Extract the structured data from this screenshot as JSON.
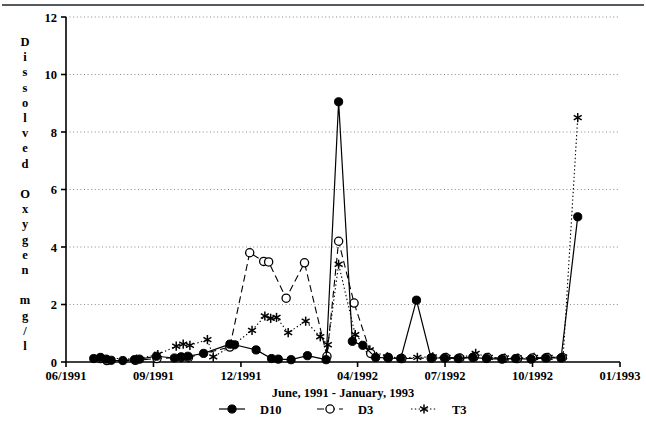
{
  "chart_data": {
    "type": "line",
    "title": "",
    "xlabel": "June, 1991 - January, 1993",
    "ylabel": "Dissolved Oxygen mg/l",
    "ylabel_letters": [
      "D",
      "i",
      "s",
      "s",
      "o",
      "l",
      "v",
      "e",
      "d",
      "",
      "O",
      "x",
      "y",
      "g",
      "e",
      "n",
      "",
      "m",
      "g",
      "/",
      "l"
    ],
    "ylim": [
      0,
      12
    ],
    "yticks": [
      0,
      2,
      4,
      6,
      8,
      10,
      12
    ],
    "ytick_labels": [
      "0",
      "2",
      "4",
      "6",
      "8",
      "10",
      "12"
    ],
    "xlim": [
      0,
      19
    ],
    "xticks": [
      0,
      3,
      6,
      10,
      13,
      16,
      19
    ],
    "xtick_labels": [
      "06/1991",
      "09/1991",
      "12/1991",
      "04/1992",
      "07/1992",
      "10/1992",
      "01/1993"
    ],
    "grid": "horizontal-dotted",
    "legend_position": "below-axis",
    "series": [
      {
        "name": "D10",
        "marker": "filled-circle",
        "line": "solid",
        "color": "#000000",
        "points": [
          {
            "x": 0.95,
            "y": 0.12
          },
          {
            "x": 1.18,
            "y": 0.16
          },
          {
            "x": 1.38,
            "y": 0.1
          },
          {
            "x": 1.55,
            "y": 0.06
          },
          {
            "x": 1.95,
            "y": 0.05
          },
          {
            "x": 2.35,
            "y": 0.08
          },
          {
            "x": 2.52,
            "y": 0.1
          },
          {
            "x": 3.1,
            "y": 0.2
          },
          {
            "x": 3.72,
            "y": 0.14
          },
          {
            "x": 3.95,
            "y": 0.18
          },
          {
            "x": 4.18,
            "y": 0.2
          },
          {
            "x": 4.72,
            "y": 0.3
          },
          {
            "x": 5.62,
            "y": 0.62
          },
          {
            "x": 5.78,
            "y": 0.6
          },
          {
            "x": 6.52,
            "y": 0.42
          },
          {
            "x": 7.05,
            "y": 0.12
          },
          {
            "x": 7.28,
            "y": 0.1
          },
          {
            "x": 7.72,
            "y": 0.08
          },
          {
            "x": 8.28,
            "y": 0.22
          },
          {
            "x": 8.92,
            "y": 0.08
          },
          {
            "x": 9.35,
            "y": 9.05
          },
          {
            "x": 9.82,
            "y": 0.72
          },
          {
            "x": 10.18,
            "y": 0.58
          },
          {
            "x": 10.62,
            "y": 0.16
          },
          {
            "x": 11.05,
            "y": 0.14
          },
          {
            "x": 11.48,
            "y": 0.12
          },
          {
            "x": 12.02,
            "y": 2.15
          },
          {
            "x": 12.52,
            "y": 0.14
          },
          {
            "x": 12.98,
            "y": 0.14
          },
          {
            "x": 13.45,
            "y": 0.12
          },
          {
            "x": 13.95,
            "y": 0.16
          },
          {
            "x": 14.42,
            "y": 0.12
          },
          {
            "x": 14.95,
            "y": 0.1
          },
          {
            "x": 15.42,
            "y": 0.12
          },
          {
            "x": 15.95,
            "y": 0.1
          },
          {
            "x": 16.45,
            "y": 0.14
          },
          {
            "x": 16.98,
            "y": 0.14
          },
          {
            "x": 17.55,
            "y": 5.05
          }
        ]
      },
      {
        "name": "D3",
        "marker": "open-circle",
        "line": "dashed",
        "color": "#000000",
        "points": [
          {
            "x": 1.18,
            "y": 0.12
          },
          {
            "x": 1.4,
            "y": 0.05
          },
          {
            "x": 2.38,
            "y": 0.06
          },
          {
            "x": 3.12,
            "y": 0.12
          },
          {
            "x": 3.95,
            "y": 0.16
          },
          {
            "x": 4.2,
            "y": 0.16
          },
          {
            "x": 5.62,
            "y": 0.52
          },
          {
            "x": 6.3,
            "y": 3.8
          },
          {
            "x": 6.78,
            "y": 3.5
          },
          {
            "x": 6.95,
            "y": 3.48
          },
          {
            "x": 7.55,
            "y": 2.22
          },
          {
            "x": 8.18,
            "y": 3.45
          },
          {
            "x": 8.95,
            "y": 0.2
          },
          {
            "x": 9.35,
            "y": 4.2
          },
          {
            "x": 9.88,
            "y": 2.05
          },
          {
            "x": 10.45,
            "y": 0.3
          },
          {
            "x": 11.05,
            "y": 0.16
          },
          {
            "x": 11.52,
            "y": 0.12
          },
          {
            "x": 12.55,
            "y": 0.14
          },
          {
            "x": 13.02,
            "y": 0.16
          },
          {
            "x": 13.5,
            "y": 0.14
          },
          {
            "x": 14.0,
            "y": 0.18
          },
          {
            "x": 14.45,
            "y": 0.16
          },
          {
            "x": 15.0,
            "y": 0.12
          },
          {
            "x": 15.48,
            "y": 0.12
          },
          {
            "x": 16.0,
            "y": 0.14
          },
          {
            "x": 16.5,
            "y": 0.16
          },
          {
            "x": 17.02,
            "y": 0.16
          }
        ]
      },
      {
        "name": "T3",
        "marker": "asterisk",
        "line": "dotted",
        "color": "#000000",
        "points": [
          {
            "x": 1.22,
            "y": 0.14
          },
          {
            "x": 2.42,
            "y": 0.1
          },
          {
            "x": 3.15,
            "y": 0.26
          },
          {
            "x": 3.78,
            "y": 0.55
          },
          {
            "x": 4.02,
            "y": 0.62
          },
          {
            "x": 4.25,
            "y": 0.58
          },
          {
            "x": 4.85,
            "y": 0.78
          },
          {
            "x": 5.05,
            "y": 0.18
          },
          {
            "x": 5.68,
            "y": 0.55
          },
          {
            "x": 6.38,
            "y": 1.1
          },
          {
            "x": 6.82,
            "y": 1.6
          },
          {
            "x": 7.02,
            "y": 1.52
          },
          {
            "x": 7.22,
            "y": 1.55
          },
          {
            "x": 7.62,
            "y": 1.02
          },
          {
            "x": 8.22,
            "y": 1.42
          },
          {
            "x": 8.72,
            "y": 0.88
          },
          {
            "x": 8.98,
            "y": 0.6
          },
          {
            "x": 9.35,
            "y": 3.4
          },
          {
            "x": 9.92,
            "y": 0.95
          },
          {
            "x": 10.42,
            "y": 0.42
          },
          {
            "x": 11.02,
            "y": 0.18
          },
          {
            "x": 11.5,
            "y": 0.14
          },
          {
            "x": 12.05,
            "y": 0.16
          },
          {
            "x": 12.58,
            "y": 0.18
          },
          {
            "x": 13.05,
            "y": 0.16
          },
          {
            "x": 13.52,
            "y": 0.14
          },
          {
            "x": 14.05,
            "y": 0.3
          },
          {
            "x": 14.5,
            "y": 0.16
          },
          {
            "x": 15.05,
            "y": 0.14
          },
          {
            "x": 15.5,
            "y": 0.14
          },
          {
            "x": 16.05,
            "y": 0.16
          },
          {
            "x": 16.55,
            "y": 0.16
          },
          {
            "x": 17.05,
            "y": 0.18
          },
          {
            "x": 17.55,
            "y": 8.5
          }
        ]
      }
    ],
    "legend": [
      {
        "label": "D10",
        "marker": "filled-circle",
        "line": "solid"
      },
      {
        "label": "D3",
        "marker": "open-circle",
        "line": "dashed"
      },
      {
        "label": "T3",
        "marker": "asterisk",
        "line": "dotted"
      }
    ]
  }
}
